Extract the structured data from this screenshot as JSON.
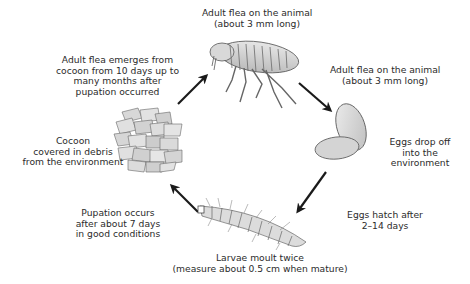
{
  "diagram": {
    "stages": [
      {
        "id": "adult-top",
        "illustration": "adult-flea",
        "lines": [
          "Adult flea on the animal",
          "(about 3 mm long)"
        ]
      },
      {
        "id": "adult-right",
        "illustration": "none",
        "lines": [
          "Adult flea on the animal",
          "(about 3 mm long)"
        ]
      },
      {
        "id": "eggs",
        "illustration": "eggs",
        "lines": [
          "Eggs drop off",
          "into the",
          "environment"
        ]
      },
      {
        "id": "hatch",
        "illustration": "none",
        "lines": [
          "Eggs hatch after",
          "2–14 days"
        ]
      },
      {
        "id": "larvae",
        "illustration": "larva",
        "lines": [
          "Larvae moult twice",
          "(measure about 0.5 cm when mature)"
        ]
      },
      {
        "id": "pupation",
        "illustration": "none",
        "lines": [
          "Pupation occurs",
          "after about 7 days",
          "in good conditions"
        ]
      },
      {
        "id": "cocoon",
        "illustration": "cocoon",
        "lines": [
          "Cocoon",
          "covered in debris",
          "from the environment"
        ]
      },
      {
        "id": "emerge",
        "illustration": "none",
        "lines": [
          "Adult flea emerges from",
          "cocoon from 10 days up to",
          "many months after",
          "pupation occurred"
        ]
      }
    ],
    "arrows": [
      {
        "from": "cocoon",
        "to": "adult-top",
        "icon": "arrow-up-right-icon"
      },
      {
        "from": "adult-top",
        "to": "eggs",
        "icon": "arrow-down-right-icon"
      },
      {
        "from": "eggs",
        "to": "larvae",
        "icon": "arrow-down-left-icon"
      },
      {
        "from": "larvae",
        "to": "cocoon",
        "icon": "arrow-up-left-icon"
      }
    ],
    "colors": {
      "text": "#2b2b2b",
      "arrow": "#1a1a1a",
      "illustration_fill": "#d9d9d9",
      "illustration_stroke": "#555555",
      "background": "#ffffff"
    }
  }
}
